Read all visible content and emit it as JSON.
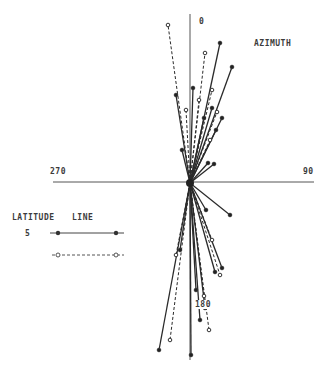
{
  "chart_data": {
    "type": "scatter",
    "subtype": "azimuth-rose (radial line plot)",
    "title": "",
    "annotation": "AZIMUTH",
    "axis_labels": {
      "top": "0",
      "right": "90",
      "bottom": "180",
      "left": "270"
    },
    "legend": {
      "title_left": "LATITUDE",
      "title_right": "LINE",
      "entries": [
        {
          "label": "5",
          "style": "solid",
          "marker": "filled-circle"
        },
        {
          "label": "",
          "style": "dashed",
          "marker": "open-circle"
        }
      ]
    },
    "center_px": [
      190,
      183
    ],
    "series": [
      {
        "name": "5",
        "style": "solid",
        "segments_end_px": [
          [
            220,
            43
          ],
          [
            232,
            67
          ],
          [
            193,
            88
          ],
          [
            176,
            95
          ],
          [
            212,
            108
          ],
          [
            222,
            118
          ],
          [
            216,
            130
          ],
          [
            204,
            118
          ],
          [
            182,
            150
          ],
          [
            208,
            163
          ],
          [
            214,
            164
          ],
          [
            230,
            215
          ],
          [
            206,
            210
          ],
          [
            159,
            350
          ],
          [
            191,
            355
          ],
          [
            200,
            320
          ],
          [
            205,
            308
          ],
          [
            215,
            272
          ],
          [
            222,
            268
          ],
          [
            180,
            250
          ],
          [
            196,
            290
          ]
        ]
      },
      {
        "name": "(unlabeled)",
        "style": "dashed",
        "segments_end_px": [
          [
            168,
            25
          ],
          [
            205,
            53
          ],
          [
            212,
            90
          ],
          [
            186,
            110
          ],
          [
            199,
            100
          ],
          [
            217,
            112
          ],
          [
            210,
            140
          ],
          [
            170,
            340
          ],
          [
            209,
            330
          ],
          [
            220,
            275
          ],
          [
            176,
            255
          ],
          [
            212,
            240
          ],
          [
            204,
            296
          ]
        ]
      }
    ],
    "background": "#ffffff",
    "line_color": "#2a2a2a"
  }
}
